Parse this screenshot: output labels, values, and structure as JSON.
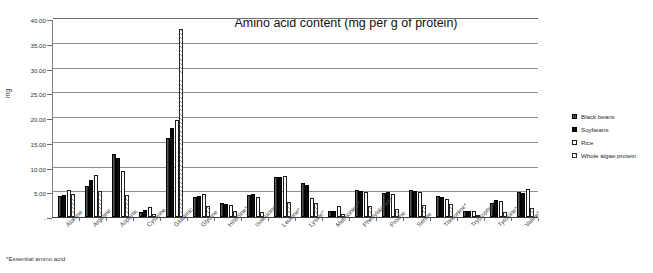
{
  "chart_data": {
    "type": "bar",
    "title": "Amino acid content (mg per g of protein)",
    "xlabel": "",
    "ylabel": "mg",
    "ylim": [
      0,
      40
    ],
    "ytick_values": [
      0,
      5,
      10,
      15,
      20,
      25,
      30,
      35,
      40
    ],
    "ytick_labels": [
      "-",
      "5.00",
      "10.00",
      "15.00",
      "20.00",
      "25.00",
      "30.00",
      "35.00",
      "40.00"
    ],
    "grid": true,
    "legend_position": "right",
    "footnote": "*Essential amino acid",
    "categories": [
      "Alanine",
      "Arginine",
      "Aspartic",
      "Cysteine",
      "Glutamic",
      "Glycine",
      "Histidine*",
      "Isoleucine*",
      "Leucine*",
      "Lysine*",
      "Methionine*",
      "Phenylalanine*",
      "Proline",
      "Serine",
      "Threonine*",
      "Tryptophan*",
      "Tyrosine*",
      "Valine*"
    ],
    "series": [
      {
        "name": "Black beans",
        "color": "#2a2a2a",
        "values": [
          4.2,
          6.3,
          12.7,
          1.1,
          16.0,
          4.0,
          2.8,
          4.5,
          8.0,
          6.9,
          1.2,
          5.5,
          4.8,
          5.5,
          4.3,
          1.2,
          2.9,
          5.0
        ]
      },
      {
        "name": "Soybeans",
        "color": "#0c0c0c",
        "values": [
          4.4,
          7.5,
          12.0,
          1.4,
          18.0,
          4.2,
          2.6,
          4.6,
          8.1,
          6.4,
          1.3,
          5.2,
          5.1,
          5.2,
          4.0,
          1.3,
          3.4,
          4.9
        ]
      },
      {
        "name": "Rice",
        "color": "#ffffff",
        "values": [
          5.4,
          8.4,
          9.3,
          2.0,
          19.5,
          4.6,
          2.4,
          4.1,
          8.2,
          3.9,
          2.3,
          5.0,
          4.6,
          5.0,
          3.6,
          1.2,
          3.3,
          5.6
        ]
      },
      {
        "name": "Whole algae protein",
        "color": "#9a9a9a",
        "values": [
          4.6,
          5.3,
          4.5,
          0.6,
          38.0,
          2.3,
          1.2,
          1.0,
          3.1,
          2.8,
          0.7,
          2.2,
          1.7,
          2.4,
          2.7,
          0.5,
          1.0,
          1.9
        ]
      }
    ]
  },
  "legend": {
    "items": [
      {
        "label": "Black beans",
        "style": "filled-dark"
      },
      {
        "label": "Soybeans",
        "style": "solid-black"
      },
      {
        "label": "Rice",
        "style": "outline-white"
      },
      {
        "label": "Whole algae protein",
        "style": "hatched"
      }
    ]
  }
}
